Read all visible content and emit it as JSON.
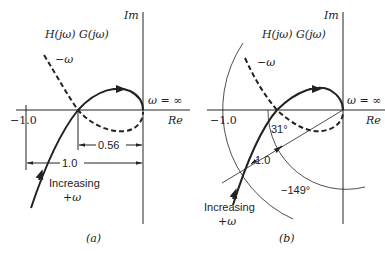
{
  "panel_a": {
    "caption": "(a)",
    "axis_im": "Im",
    "axis_re": "Re",
    "function_label": "H(jω) G(jω)",
    "neg_omega_label": "−ω",
    "omega_inf_label": "ω = ∞",
    "minus_one_label": "−1.0",
    "gain_crossing_dim": "0.56",
    "unit_dim": "1.0",
    "increasing_label_1": "Increasing",
    "increasing_label_2": "+ω"
  },
  "panel_b": {
    "caption": "(b)",
    "axis_im": "Im",
    "axis_re": "Re",
    "function_label": "H(jω) G(jω)",
    "neg_omega_label": "−ω",
    "omega_inf_label": "ω = ∞",
    "minus_one_label": "−1.0",
    "phase_margin_label": "31°",
    "unit_radius_label": "1.0",
    "phase_angle_label": "−149°",
    "increasing_label_1": "Increasing",
    "increasing_label_2": "+ω"
  },
  "colors": {
    "ink": "#222222",
    "background": "#ffffff"
  }
}
